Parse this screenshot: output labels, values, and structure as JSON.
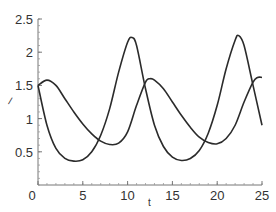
{
  "chart_data": {
    "type": "line",
    "title": "",
    "xlabel": "t",
    "ylabel": "/",
    "xlim": [
      0,
      25
    ],
    "ylim": [
      0,
      2.5
    ],
    "grid": false,
    "legend": null,
    "x_ticks": [
      "0",
      "5",
      "10",
      "15",
      "20",
      "25"
    ],
    "y_ticks": [
      "0.5",
      "1",
      "1.5",
      "2",
      "2.5"
    ],
    "series": [
      {
        "name": "curve-a",
        "color": "#2b2b2b",
        "x": [
          0,
          1,
          2,
          3,
          4,
          5,
          6,
          7,
          8,
          9,
          10,
          10.5,
          11,
          12,
          13,
          14,
          15,
          16,
          17,
          18,
          19,
          20,
          21,
          22,
          22.4,
          23,
          24,
          25
        ],
        "y": [
          1.5,
          0.9,
          0.55,
          0.4,
          0.36,
          0.38,
          0.5,
          0.75,
          1.15,
          1.7,
          2.15,
          2.22,
          2.1,
          1.45,
          0.9,
          0.58,
          0.42,
          0.37,
          0.4,
          0.52,
          0.78,
          1.2,
          1.75,
          2.18,
          2.25,
          2.1,
          1.5,
          0.9
        ]
      },
      {
        "name": "curve-b",
        "color": "#2b2b2b",
        "x": [
          0,
          1,
          2,
          3,
          4,
          5,
          6,
          7,
          8,
          9,
          10,
          11,
          12,
          12.5,
          13,
          14,
          15,
          16,
          17,
          18,
          19,
          20,
          21,
          22,
          23,
          24,
          24.5,
          25
        ],
        "y": [
          1.5,
          1.58,
          1.5,
          1.3,
          1.1,
          0.92,
          0.77,
          0.66,
          0.61,
          0.63,
          0.8,
          1.2,
          1.55,
          1.6,
          1.58,
          1.45,
          1.25,
          1.05,
          0.87,
          0.72,
          0.64,
          0.62,
          0.7,
          0.9,
          1.25,
          1.55,
          1.62,
          1.62
        ]
      }
    ]
  },
  "axes": {
    "x_label": "t",
    "y_label": "/"
  }
}
